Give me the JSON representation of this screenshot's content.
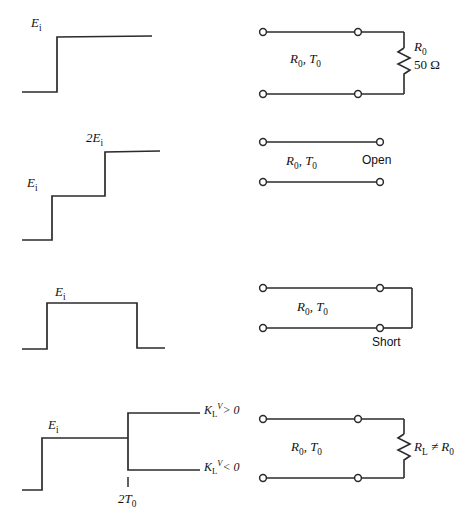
{
  "figure": {
    "stroke_color": "#2b2b2b",
    "text_color": "#111111",
    "background": "#ffffff",
    "rows": [
      {
        "id": "matched-load",
        "waveform": {
          "name": "step-waveform-matched",
          "labels": [
            {
              "key": "ei",
              "text": "Ei",
              "base": "E",
              "sub": "i"
            }
          ]
        },
        "circuit": {
          "name": "circuit-matched-load",
          "line_label": "R0, T0",
          "line_label_base": "R",
          "line_label_sub": "0",
          "line_label_base2": "T",
          "line_label_sub2": "0",
          "load_type": "resistor",
          "load_label_1": "R0",
          "load_label_1_base": "R",
          "load_label_1_sub": "0",
          "load_label_2": "50 Ω"
        }
      },
      {
        "id": "open-circuit",
        "waveform": {
          "name": "double-step-waveform-open",
          "labels": [
            {
              "key": "ei",
              "text": "Ei",
              "base": "E",
              "sub": "i"
            },
            {
              "key": "two_ei",
              "text": "2Ei",
              "base": "2E",
              "sub": "i"
            }
          ]
        },
        "circuit": {
          "name": "circuit-open",
          "line_label_base": "R",
          "line_label_sub": "0",
          "line_label_base2": "T",
          "line_label_sub2": "0",
          "load_type": "open",
          "load_label": "Open"
        }
      },
      {
        "id": "short-circuit",
        "waveform": {
          "name": "pulse-waveform-short",
          "labels": [
            {
              "key": "ei",
              "text": "Ei",
              "base": "E",
              "sub": "i"
            }
          ]
        },
        "circuit": {
          "name": "circuit-short",
          "line_label_base": "R",
          "line_label_sub": "0",
          "line_label_base2": "T",
          "line_label_sub2": "0",
          "load_type": "short",
          "load_label": "Short"
        }
      },
      {
        "id": "mismatched-load",
        "waveform": {
          "name": "branching-waveform-mismatch",
          "labels": [
            {
              "key": "ei",
              "text": "Ei",
              "base": "E",
              "sub": "i"
            },
            {
              "key": "k_pos",
              "base": "K",
              "sub": "L",
              "sup": "V",
              "rel": "> 0"
            },
            {
              "key": "k_neg",
              "base": "K",
              "sub": "L",
              "sup": "V",
              "rel": "< 0"
            },
            {
              "key": "two_t0",
              "base": "2T",
              "sub": "0"
            }
          ]
        },
        "circuit": {
          "name": "circuit-mismatched-load",
          "line_label_base": "R",
          "line_label_sub": "0",
          "line_label_base2": "T",
          "line_label_sub2": "0",
          "load_type": "resistor",
          "load_label_base": "R",
          "load_label_sub": "L",
          "load_label_rel": "≠ R",
          "load_label_rel_sub": "0"
        }
      }
    ]
  }
}
